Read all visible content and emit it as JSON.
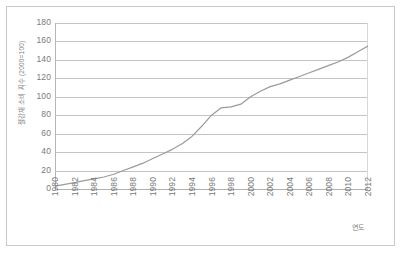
{
  "chart_data": {
    "type": "line",
    "title": "",
    "xlabel": "연도",
    "ylabel": "철강재 소비 지수 (2000=100)",
    "ylim": [
      0,
      180
    ],
    "xlim": [
      1980,
      2012
    ],
    "grid": true,
    "legend": "none",
    "yticks": [
      0,
      20,
      40,
      60,
      80,
      100,
      120,
      140,
      160,
      180
    ],
    "xticks": [
      1980,
      1982,
      1984,
      1986,
      1988,
      1990,
      1992,
      1994,
      1996,
      1998,
      2000,
      2002,
      2004,
      2006,
      2008,
      2010,
      2012
    ],
    "series": [
      {
        "name": "철강재 소비 지수",
        "color": "#9a9a9a",
        "x": [
          1980,
          1981,
          1982,
          1983,
          1984,
          1985,
          1986,
          1987,
          1988,
          1989,
          1990,
          1991,
          1992,
          1993,
          1994,
          1995,
          1996,
          1997,
          1998,
          1999,
          2000,
          2001,
          2002,
          2003,
          2004,
          2005,
          2006,
          2007,
          2008,
          2009,
          2010,
          2011,
          2012
        ],
        "values": [
          3,
          5,
          7,
          9,
          11,
          13,
          16,
          20,
          24,
          28,
          33,
          38,
          43,
          49,
          57,
          68,
          80,
          88,
          89,
          92,
          100,
          106,
          111,
          114,
          118,
          122,
          126,
          130,
          134,
          138,
          143,
          149,
          155
        ]
      }
    ]
  },
  "axis": {
    "y_title": "철강재 소비 지수 (2000=100)",
    "x_title": "연도"
  }
}
